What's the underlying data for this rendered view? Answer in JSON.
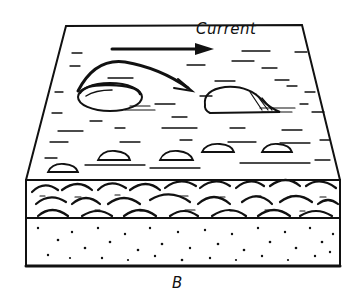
{
  "diagram": {
    "type": "geological block diagram",
    "current_label": "Current",
    "figure_label": "B",
    "layers": [
      {
        "name": "water surface / flow zone",
        "pattern": "horizontal dashes"
      },
      {
        "name": "imbricated pebble layer",
        "pattern": "overlapping arcs"
      },
      {
        "name": "sand layer",
        "pattern": "stipple dots"
      }
    ],
    "elements": [
      {
        "name": "current arrow",
        "direction": "right"
      },
      {
        "name": "flip arrow",
        "description": "curved arrow showing pebble overturning"
      },
      {
        "name": "upturned pebble"
      },
      {
        "name": "stable pebble"
      }
    ],
    "colors": {
      "ink": "#111111",
      "background": "#ffffff"
    }
  }
}
